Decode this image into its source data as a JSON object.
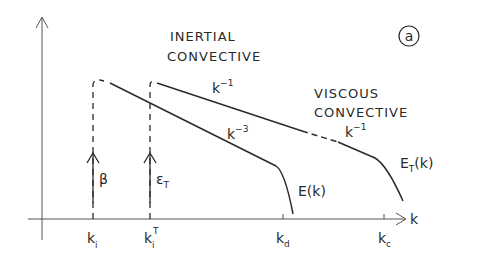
{
  "figure": {
    "panel_label": "a",
    "x_axis_label": "k",
    "regions": {
      "inertial_line1": "INERTIAL",
      "inertial_line2": "CONVECTIVE",
      "viscous_line1": "VISCOUS",
      "viscous_line2": "CONVECTIVE"
    },
    "slopes": {
      "inertial_ET": {
        "base": "k",
        "exp": "−1"
      },
      "inertial_E": {
        "base": "k",
        "exp": "−3"
      },
      "viscous_ET": {
        "base": "k",
        "exp": "−1"
      }
    },
    "curves": {
      "E": {
        "label": "E(k)"
      },
      "ET": {
        "base": "E",
        "sub": "T",
        "rest": "(k)"
      }
    },
    "injections": {
      "beta": "β",
      "epsT": {
        "base": "ε",
        "sub": "T"
      }
    },
    "ticks": {
      "ki": {
        "base": "k",
        "sub": "i"
      },
      "kiT": {
        "base": "k",
        "sub": "i",
        "sup": "T"
      },
      "kd": {
        "base": "k",
        "sub": "d"
      },
      "kc": {
        "base": "k",
        "sub": "c"
      }
    },
    "colors": {
      "ink": "#2a2a2a",
      "axis": "#555555",
      "background": "#ffffff"
    }
  }
}
